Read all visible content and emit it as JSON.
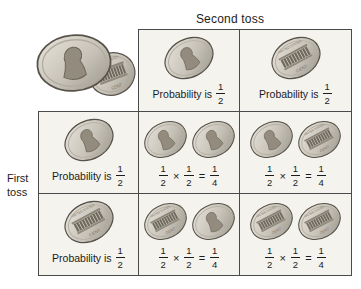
{
  "title": "Second toss",
  "axis_label_line1": "First",
  "axis_label_line2": "toss",
  "colors": {
    "cell_background": "#f4f3ee",
    "grid_border": "#4a4a4a",
    "text": "#1c1c1c",
    "coin_highlight": "#e8e4dc",
    "coin_shadow": "#9a958a",
    "coin_rim": "#57534a",
    "memorial_band": "#6f6a5f"
  },
  "icons": {
    "heads": "penny-heads-icon",
    "tails": "penny-tails-icon"
  },
  "coin_art": {
    "tails_text_top": "UNITED STATES",
    "tails_text_bottom": "CENT"
  },
  "decorative_coins": [
    "heads",
    "tails"
  ],
  "header_cells": [
    {
      "coin": "heads",
      "label": "Probability is",
      "frac_num": "1",
      "frac_den": "2"
    },
    {
      "coin": "tails",
      "label": "Probability is",
      "frac_num": "1",
      "frac_den": "2"
    }
  ],
  "row_labels": [
    {
      "coin": "heads",
      "label": "Probability is",
      "frac_num": "1",
      "frac_den": "2"
    },
    {
      "coin": "tails",
      "label": "Probability is",
      "frac_num": "1",
      "frac_den": "2"
    }
  ],
  "cells": [
    {
      "coins": [
        "heads",
        "heads"
      ],
      "f1n": "1",
      "f1d": "2",
      "op": "×",
      "f2n": "1",
      "f2d": "2",
      "eq": "=",
      "rn": "1",
      "rd": "4"
    },
    {
      "coins": [
        "heads",
        "tails"
      ],
      "f1n": "1",
      "f1d": "2",
      "op": "×",
      "f2n": "1",
      "f2d": "2",
      "eq": "=",
      "rn": "1",
      "rd": "4"
    },
    {
      "coins": [
        "tails",
        "heads"
      ],
      "f1n": "1",
      "f1d": "2",
      "op": "×",
      "f2n": "1",
      "f2d": "2",
      "eq": "=",
      "rn": "1",
      "rd": "4"
    },
    {
      "coins": [
        "tails",
        "tails"
      ],
      "f1n": "1",
      "f1d": "2",
      "op": "×",
      "f2n": "1",
      "f2d": "2",
      "eq": "=",
      "rn": "1",
      "rd": "4"
    }
  ]
}
